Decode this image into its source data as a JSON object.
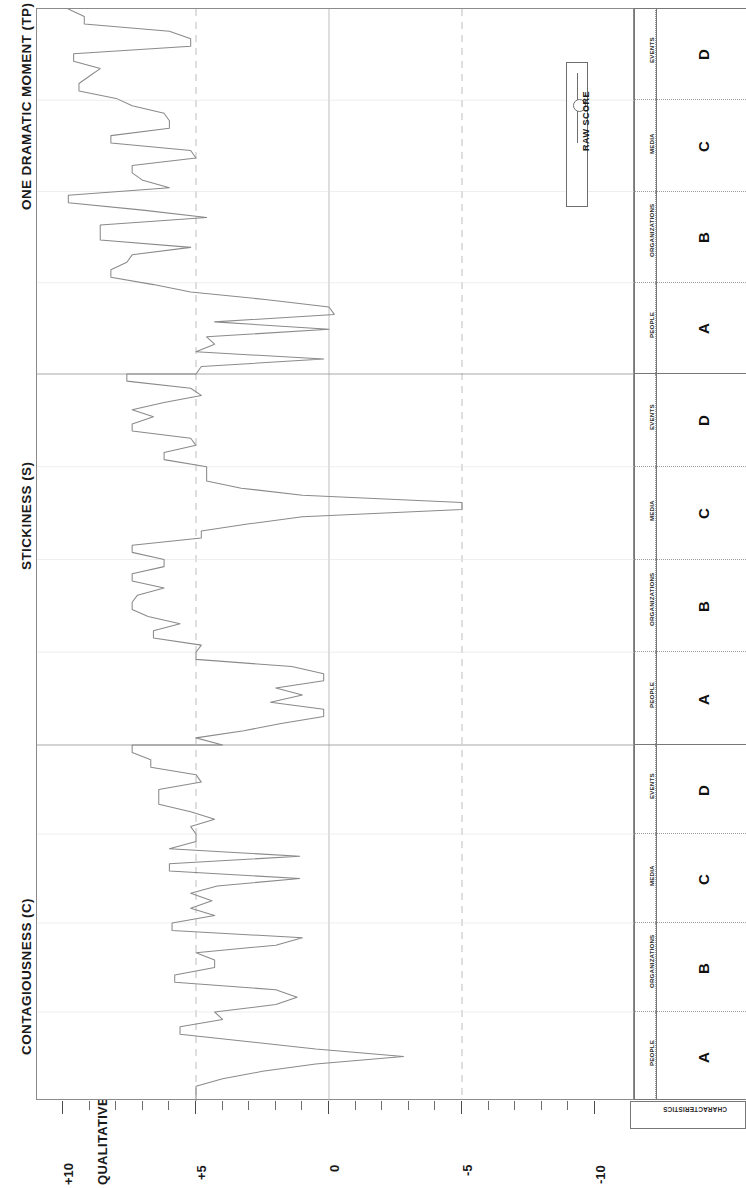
{
  "chart_data": {
    "type": "line",
    "title": "",
    "orientation": "rotated-90",
    "xlabel": "CHARACTERISTICS",
    "ylabel": "QUALITATIVE SCALE",
    "ylim": [
      -10,
      10
    ],
    "grid": true,
    "legend": {
      "position": "inside-right",
      "entries": [
        "RAW SCORE"
      ]
    },
    "axis_ticks": {
      "labeled": [
        "+10",
        "+5",
        "0",
        "-5",
        "-10"
      ],
      "labeled_values": [
        10,
        5,
        0,
        -5,
        -10
      ],
      "minor_step": 1
    },
    "reference_lines": [
      {
        "value": 5,
        "style": "dashed"
      },
      {
        "value": 0,
        "style": "solid"
      },
      {
        "value": -5,
        "style": "dashed"
      }
    ],
    "sections": [
      {
        "name": "CONTAGIOUSNESS (C)",
        "categories": [
          "PEOPLE",
          "ORGANIZATIONS",
          "MEDIA",
          "EVENTS"
        ],
        "category_codes": [
          "A",
          "B",
          "C",
          "D"
        ],
        "series": [
          {
            "name": "RAW SCORE",
            "values": [
              5.0,
              5.0,
              5.0,
              4.0,
              2.5,
              0.5,
              -2.8,
              0.5,
              3.0,
              5.6,
              5.6,
              4.0,
              4.3,
              2.0,
              1.2,
              2.0,
              5.8,
              5.8,
              4.3,
              4.3,
              5.0,
              2.0,
              1.0,
              5.9,
              5.9,
              4.3,
              5.2,
              4.4,
              5.2,
              4.2,
              1.1,
              6.0,
              6.0,
              1.1,
              6.0,
              5.0,
              5.0,
              5.2,
              4.3,
              5.2,
              6.4,
              6.4,
              6.4,
              4.8,
              5.0,
              6.7,
              6.7,
              7.4,
              7.4
            ]
          }
        ]
      },
      {
        "name": "STICKINESS (S)",
        "categories": [
          "PEOPLE",
          "ORGANIZATIONS",
          "MEDIA",
          "EVENTS"
        ],
        "category_codes": [
          "A",
          "B",
          "C",
          "D"
        ],
        "series": [
          {
            "name": "RAW SCORE",
            "values": [
              4.0,
              5.0,
              3.2,
              1.8,
              0.2,
              0.2,
              2.2,
              1.0,
              2.0,
              0.2,
              0.2,
              1.4,
              5.0,
              5.0,
              4.8,
              6.6,
              6.6,
              5.6,
              6.8,
              7.4,
              7.4,
              7.2,
              6.2,
              7.4,
              7.4,
              6.2,
              6.2,
              7.4,
              7.4,
              4.8,
              4.8,
              3.0,
              1.0,
              -5.0,
              -5.0,
              1.0,
              3.3,
              4.6,
              4.6,
              4.6,
              6.2,
              6.2,
              5.0,
              5.2,
              7.4,
              7.4,
              6.6,
              7.4,
              6.2,
              4.8,
              5.2,
              7.6,
              7.6
            ]
          }
        ]
      },
      {
        "name": "ONE DRAMATIC MOMENT (TP)",
        "categories": [
          "PEOPLE",
          "ORGANIZATIONS",
          "MEDIA",
          "EVENTS"
        ],
        "category_codes": [
          "A",
          "B",
          "C",
          "D"
        ],
        "series": [
          {
            "name": "RAW SCORE",
            "values": [
              5.0,
              4.8,
              0.2,
              5.0,
              4.3,
              4.6,
              0.0,
              4.3,
              -0.2,
              0.0,
              2.4,
              5.2,
              6.6,
              8.2,
              8.2,
              7.6,
              7.4,
              5.2,
              8.6,
              8.6,
              8.6,
              4.6,
              7.0,
              9.8,
              9.8,
              6.0,
              7.0,
              7.4,
              7.4,
              5.0,
              5.2,
              8.2,
              8.2,
              6.0,
              6.0,
              6.2,
              7.4,
              8.0,
              9.4,
              9.4,
              9.0,
              8.6,
              9.6,
              9.6,
              5.2,
              5.2,
              6.0,
              9.2,
              9.2,
              9.8
            ]
          }
        ]
      }
    ]
  },
  "titles": {
    "section_top": "ONE DRAMATIC MOMENT (TP)",
    "section_mid": "STICKINESS (S)",
    "section_bottom": "CONTAGIOUSNESS (C)"
  },
  "axis": {
    "value_axis_title": "QUALITATIVE SCALE",
    "category_axis_title": "CHARACTERISTICS",
    "tick_labels": [
      "+10",
      "+5",
      "0",
      "-5",
      "-10"
    ]
  },
  "legend": {
    "series_label": "RAW SCORE",
    "marker": "line-circle-marker"
  },
  "table": {
    "columns": [
      "category_name",
      "category_code"
    ],
    "sections": [
      {
        "section": "ONE DRAMATIC MOMENT (TP)",
        "rows": [
          {
            "name": "EVENTS",
            "code": "D"
          },
          {
            "name": "MEDIA",
            "code": "C"
          },
          {
            "name": "ORGANIZATIONS",
            "code": "B"
          },
          {
            "name": "PEOPLE",
            "code": "A"
          }
        ]
      },
      {
        "section": "STICKINESS (S)",
        "rows": [
          {
            "name": "EVENTS",
            "code": "D"
          },
          {
            "name": "MEDIA",
            "code": "C"
          },
          {
            "name": "ORGANIZATIONS",
            "code": "B"
          },
          {
            "name": "PEOPLE",
            "code": "A"
          }
        ]
      },
      {
        "section": "CONTAGIOUSNESS (C)",
        "rows": [
          {
            "name": "EVENTS",
            "code": "D"
          },
          {
            "name": "MEDIA",
            "code": "C"
          },
          {
            "name": "ORGANIZATIONS",
            "code": "B"
          },
          {
            "name": "PEOPLE",
            "code": "A"
          }
        ]
      }
    ]
  },
  "style": {
    "line_color": "#8a8a8a",
    "frame_color": "#8b8b8b",
    "grid_color": "#b5b5b5",
    "text_color": "#1a1a1a",
    "background": "#ffffff"
  }
}
